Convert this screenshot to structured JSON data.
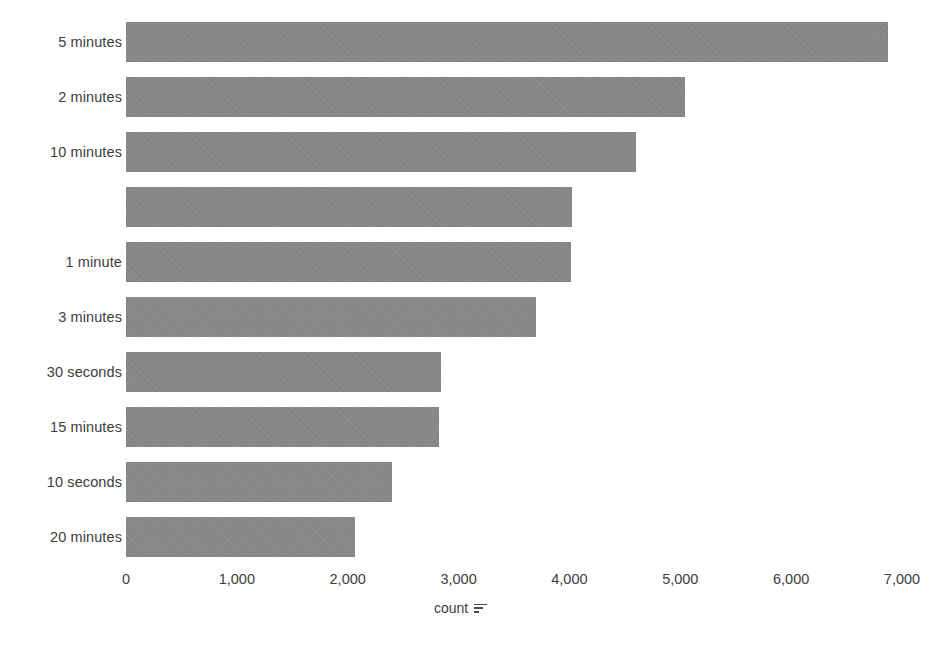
{
  "chart_data": {
    "type": "bar",
    "orientation": "horizontal",
    "title": "",
    "xlabel": "count",
    "ylabel": "",
    "xlim": [
      0,
      7000
    ],
    "xticks": [
      0,
      1000,
      2000,
      3000,
      4000,
      5000,
      6000,
      7000
    ],
    "xtick_labels": [
      "0",
      "1,000",
      "2,000",
      "3,000",
      "4,000",
      "5,000",
      "6,000",
      "7,000"
    ],
    "grid": false,
    "legend": false,
    "bar_color": "#8a8a8a",
    "categories": [
      "5 minutes",
      "2 minutes",
      "10 minutes",
      "",
      "1 minute",
      "3 minutes",
      "30 seconds",
      "15 minutes",
      "10 seconds",
      "20 minutes"
    ],
    "values": [
      6870,
      5040,
      4600,
      4020,
      4010,
      3700,
      2840,
      2820,
      2400,
      2070
    ],
    "bars": [
      {
        "label": "5 minutes",
        "value": 6870
      },
      {
        "label": "2 minutes",
        "value": 5040
      },
      {
        "label": "10 minutes",
        "value": 4600
      },
      {
        "label": "",
        "value": 4020
      },
      {
        "label": "1 minute",
        "value": 4010
      },
      {
        "label": "3 minutes",
        "value": 3700
      },
      {
        "label": "30 seconds",
        "value": 2840
      },
      {
        "label": "15 minutes",
        "value": 2820
      },
      {
        "label": "10 seconds",
        "value": 2400
      },
      {
        "label": "20 minutes",
        "value": 2070
      }
    ]
  },
  "axis": {
    "title_text": "count",
    "sort_icon_name": "sort-descending-icon"
  }
}
